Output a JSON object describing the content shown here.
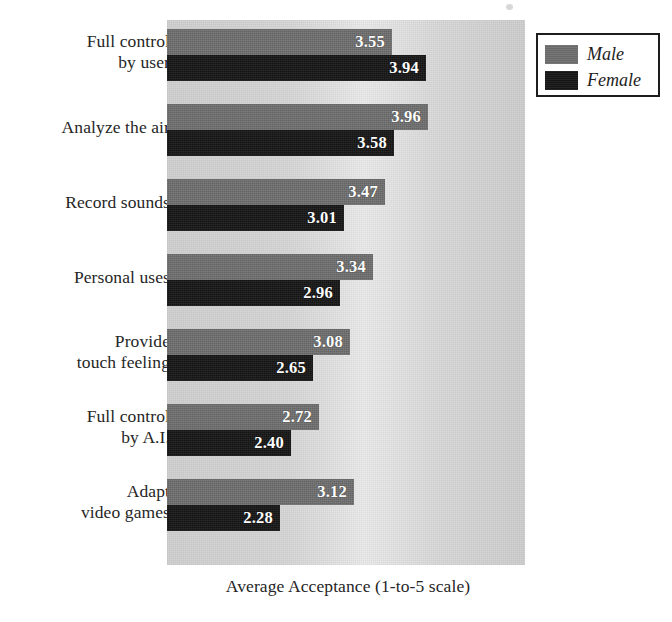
{
  "chart_data": {
    "type": "bar",
    "orientation": "horizontal",
    "title": "",
    "xlabel": "Average Acceptance (1-to-5 scale)",
    "ylabel": "",
    "xlim": [
      1,
      5
    ],
    "grid": false,
    "legend_position": "top-right",
    "categories": [
      "Full control by user",
      "Analyze the air",
      "Record sounds",
      "Personal uses",
      "Provide touch feeling",
      "Full control by A.I.",
      "Adapt video games"
    ],
    "category_lines": [
      [
        "Full control",
        "by user"
      ],
      [
        "Analyze the air"
      ],
      [
        "Record sounds"
      ],
      [
        "Personal uses"
      ],
      [
        "Provide",
        "touch feeling"
      ],
      [
        "Full control",
        "by A.I."
      ],
      [
        "Adapt",
        "video games"
      ]
    ],
    "series": [
      {
        "name": "Male",
        "color": "#6e6e6e",
        "values": [
          3.55,
          3.96,
          3.47,
          3.34,
          3.08,
          2.72,
          3.12
        ],
        "labels": [
          "3.55",
          "3.96",
          "3.47",
          "3.34",
          "3.08",
          "2.72",
          "3.12"
        ]
      },
      {
        "name": "Female",
        "color": "#161616",
        "values": [
          3.94,
          3.58,
          3.01,
          2.96,
          2.65,
          2.4,
          2.28
        ],
        "labels": [
          "3.94",
          "3.58",
          "3.01",
          "2.96",
          "2.65",
          "2.40",
          "2.28"
        ]
      }
    ]
  },
  "legend": {
    "items": [
      {
        "label": "Male",
        "color": "#6e6e6e"
      },
      {
        "label": "Female",
        "color": "#161616"
      }
    ]
  },
  "axis": {
    "x_title": "Average Acceptance (1-to-5 scale)"
  },
  "style": {
    "male_color": "#6e6e6e",
    "female_color": "#161616",
    "plot_background": "#d9d9d9",
    "text_color": "#262626"
  }
}
